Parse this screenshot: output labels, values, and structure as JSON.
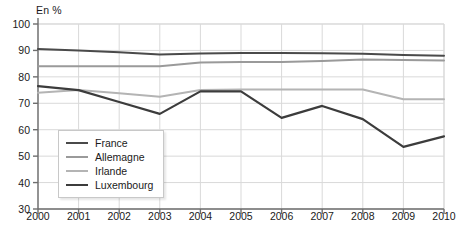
{
  "chart_data": {
    "type": "line",
    "title": "",
    "unit_label": "En %",
    "xlabel": "",
    "ylabel": "",
    "x": [
      2000,
      2001,
      2002,
      2003,
      2004,
      2005,
      2006,
      2007,
      2008,
      2009,
      2010
    ],
    "xtick_labels": [
      "2000",
      "2001",
      "2002",
      "2003",
      "2004",
      "2005",
      "2006",
      "2007",
      "2008",
      "2009",
      "2010"
    ],
    "ytick_labels": [
      "30",
      "40",
      "50",
      "60",
      "70",
      "80",
      "90",
      "100"
    ],
    "yticks": [
      30,
      40,
      50,
      60,
      70,
      80,
      90,
      100
    ],
    "ylim": [
      30,
      100
    ],
    "xlim": [
      2000,
      2010
    ],
    "grid": true,
    "legend_position": "inside-lower-left",
    "series": [
      {
        "name": "France",
        "color": "#4a4a4a",
        "width": 2.0,
        "values": [
          90.5,
          90.0,
          89.3,
          88.5,
          88.8,
          89.0,
          89.0,
          88.9,
          88.7,
          88.3,
          88.0
        ]
      },
      {
        "name": "Allemagne",
        "color": "#9a9a9a",
        "width": 2.0,
        "values": [
          84.0,
          84.0,
          84.0,
          84.0,
          85.4,
          85.6,
          85.6,
          86.0,
          86.6,
          86.4,
          86.2
        ]
      },
      {
        "name": "Irlande",
        "color": "#b4b4b4",
        "width": 2.0,
        "values": [
          74.0,
          75.0,
          73.8,
          72.5,
          75.0,
          75.2,
          75.2,
          75.2,
          75.2,
          71.5,
          71.5
        ]
      },
      {
        "name": "Luxembourg",
        "color": "#3c3c3c",
        "width": 2.2,
        "values": [
          76.5,
          75.0,
          70.5,
          66.0,
          74.5,
          74.5,
          64.5,
          69.0,
          64.0,
          53.5,
          57.5
        ]
      }
    ]
  },
  "legend": {
    "items": [
      {
        "label": "France"
      },
      {
        "label": "Allemagne"
      },
      {
        "label": "Irlande"
      },
      {
        "label": "Luxembourg"
      }
    ]
  },
  "colors": {
    "axis": "#6e6e6e",
    "grid": "#d9d9d9",
    "text": "#1a1a1a",
    "background": "#ffffff"
  }
}
